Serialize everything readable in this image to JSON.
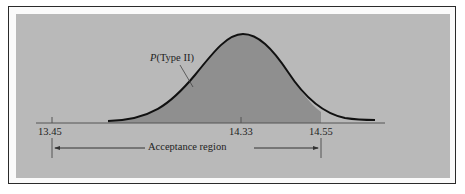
{
  "figure": {
    "curve_label": "P(Type II)",
    "curve_label_italic": "P",
    "curve_label_rest": "(Type II)",
    "region_label": "Acceptance region",
    "ticks": [
      {
        "label": "13.45",
        "x": 52
      },
      {
        "label": "14.33",
        "x": 241
      },
      {
        "label": "14.55",
        "x": 321
      }
    ],
    "colors": {
      "background": "#b9b9b9",
      "shaded_area": "#8f8f8f",
      "curve": "#111111",
      "frame": "#2a2a2a"
    }
  }
}
